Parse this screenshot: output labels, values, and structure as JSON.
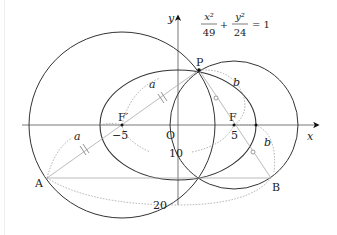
{
  "equation": {
    "num1": "x²",
    "den1": "49",
    "plus": "+",
    "num2": "y²",
    "den2": "24",
    "rhs": "= 1"
  },
  "axes": {
    "x_label": "x",
    "y_label": "y",
    "origin_label": "O"
  },
  "points": {
    "P": "P",
    "A": "A",
    "B": "B",
    "F": "F",
    "F_prime": "F′"
  },
  "tick_labels": {
    "neg5": "−5",
    "pos5": "5",
    "ten": "10",
    "twenty": "20"
  },
  "segment_labels": {
    "a1": "a",
    "a2": "a",
    "b1": "b",
    "b2": "b"
  },
  "colors": {
    "stroke": "#333333",
    "light": "#aaaaaa",
    "dotted": "#999999"
  }
}
